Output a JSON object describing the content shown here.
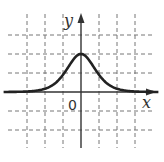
{
  "chart_data": {
    "type": "line",
    "title": "",
    "xlabel": "x",
    "ylabel": "y",
    "origin_label": "0",
    "xlim": [
      -4.5,
      4.5
    ],
    "ylim": [
      -3.5,
      4.3
    ],
    "grid": true,
    "grid_style": "dashed",
    "grid_x": [
      -3,
      -2,
      -1,
      1,
      2,
      3
    ],
    "grid_y": [
      -2,
      -1,
      1,
      2,
      3
    ],
    "series": [
      {
        "name": "bell curve",
        "description": "Bell-shaped curve symmetric about the y-axis, peak at (0, 2), approaching 0 as |x| grows",
        "x": [
          -4.5,
          -3,
          -2,
          -1.5,
          -1,
          -0.5,
          0,
          0.5,
          1,
          1.5,
          2,
          3,
          4.5
        ],
        "y": [
          0,
          0.02,
          0.15,
          0.4,
          0.9,
          1.6,
          2,
          1.6,
          0.9,
          0.4,
          0.15,
          0.02,
          0
        ]
      }
    ],
    "colors": {
      "curve": "#222222",
      "axes": "#333333",
      "grid": "#777777"
    }
  }
}
